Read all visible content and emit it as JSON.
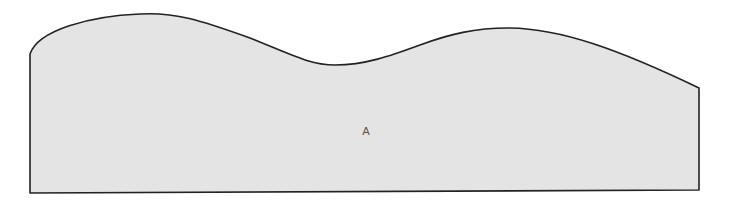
{
  "diagram": {
    "shape": {
      "name": "wavy-top-region",
      "fill": "#e4e4e4",
      "stroke": "#222222",
      "label": "A"
    },
    "label_position": {
      "x": 366,
      "y": 131
    }
  }
}
